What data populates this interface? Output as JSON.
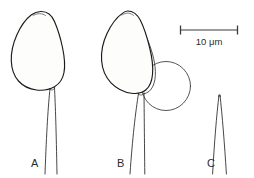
{
  "figure": {
    "type": "scientific-line-drawing",
    "background_color": "#ffffff",
    "ink_color": "#1a1a1a"
  },
  "scale_bar": {
    "label": "10 μm",
    "value": 10,
    "unit": "μm",
    "length_px": 58,
    "position": "top-right"
  },
  "panels": [
    {
      "id": "A",
      "label": "A",
      "body": {
        "shape": "ovoid-teardrop",
        "texture": "stippled",
        "has_vesicle": false
      },
      "stalk": {
        "present": true,
        "style": "two-line-tapering"
      }
    },
    {
      "id": "B",
      "label": "B",
      "body": {
        "shape": "ovoid-pointed",
        "texture": "stippled",
        "has_vesicle": true
      },
      "vesicle": {
        "shape": "circle",
        "texture": "clear-outline",
        "position": "lower-right"
      },
      "stalk": {
        "present": true,
        "style": "two-line-tapering"
      }
    },
    {
      "id": "C",
      "label": "C",
      "body": {
        "shape": "none",
        "texture": "none",
        "has_vesicle": false
      },
      "stalk": {
        "present": true,
        "style": "narrow-pointed-tapering"
      }
    }
  ]
}
